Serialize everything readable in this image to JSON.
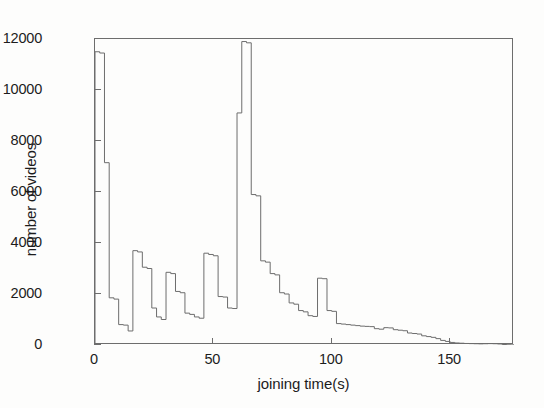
{
  "chart_data": {
    "type": "line",
    "subtype": "step-histogram",
    "title": "",
    "xlabel": "joining time(s)",
    "ylabel": "number of videos",
    "xlim": [
      0,
      177
    ],
    "ylim": [
      0,
      12000
    ],
    "xticks": [
      0,
      50,
      100,
      150
    ],
    "yticks": [
      0,
      2000,
      4000,
      6000,
      8000,
      10000,
      12000
    ],
    "xtick_labels": [
      "0",
      "50",
      "100",
      "150"
    ],
    "ytick_labels": [
      "0",
      "2000",
      "4000",
      "6000",
      "8000",
      "10000",
      "12000"
    ],
    "grid": false,
    "legend": null,
    "line_color": "#6d6d6d",
    "background_color": "#fdfdfc",
    "axis_color": "#6d6d6d",
    "bin_width": 2,
    "x": [
      0,
      2,
      4,
      6,
      8,
      10,
      12,
      14,
      16,
      18,
      20,
      22,
      24,
      26,
      28,
      30,
      32,
      34,
      36,
      38,
      40,
      42,
      44,
      46,
      48,
      50,
      52,
      54,
      56,
      58,
      60,
      62,
      64,
      66,
      68,
      70,
      72,
      74,
      76,
      78,
      80,
      82,
      84,
      86,
      88,
      90,
      92,
      94,
      96,
      98,
      100,
      102,
      104,
      106,
      108,
      110,
      112,
      114,
      116,
      118,
      120,
      122,
      124,
      126,
      128,
      130,
      132,
      134,
      136,
      138,
      140,
      142,
      144,
      146,
      148,
      150,
      152,
      154,
      156,
      158,
      160,
      162,
      164,
      166,
      168,
      170,
      172,
      174,
      176
    ],
    "values": [
      11500,
      11450,
      7150,
      1850,
      1800,
      800,
      780,
      550,
      3700,
      3650,
      3050,
      3000,
      1450,
      1100,
      1000,
      2850,
      2800,
      2100,
      2050,
      1250,
      1200,
      1100,
      1050,
      3600,
      3550,
      3500,
      1900,
      1880,
      1450,
      1430,
      9100,
      11900,
      11850,
      5900,
      5850,
      3300,
      3250,
      2800,
      2750,
      2050,
      2000,
      1650,
      1600,
      1350,
      1300,
      1150,
      1120,
      2620,
      2600,
      1350,
      1320,
      840,
      820,
      800,
      780,
      760,
      740,
      730,
      720,
      640,
      620,
      680,
      670,
      600,
      580,
      560,
      470,
      450,
      430,
      360,
      330,
      300,
      250,
      180,
      140,
      100,
      80,
      70,
      60,
      55,
      50,
      45,
      50,
      55,
      50,
      40,
      20,
      10,
      5
    ],
    "annotations": [
      {
        "label": "initial spike near 0-4 s",
        "x": 2,
        "y": 11500
      },
      {
        "label": "dominant peak near 62-65 s",
        "x": 63,
        "y": 11900
      },
      {
        "label": "secondary bump near 94-96 s",
        "x": 95,
        "y": 2620
      }
    ]
  }
}
